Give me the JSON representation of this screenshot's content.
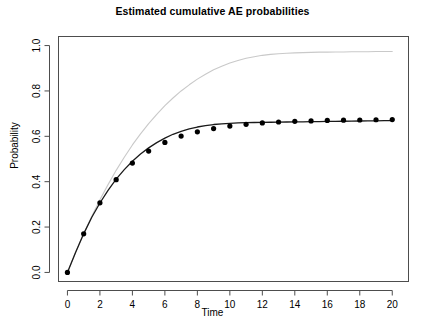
{
  "chart_data": {
    "type": "line",
    "title": "Estimated cumulative AE probabilities",
    "xlabel": "Time",
    "ylabel": "Probability",
    "xlim": [
      -0.55,
      21.0
    ],
    "ylim": [
      -0.04,
      1.04
    ],
    "xticks": [
      0,
      2,
      4,
      6,
      8,
      10,
      12,
      14,
      16,
      18,
      20
    ],
    "xticklabels": [
      "0",
      "2",
      "4",
      "6",
      "8",
      "10",
      "12",
      "14",
      "16",
      "18",
      "20"
    ],
    "yticks": [
      0.0,
      0.2,
      0.4,
      0.6,
      0.8,
      1.0
    ],
    "yticklabels": [
      "0.0",
      "0.2",
      "0.4",
      "0.6",
      "0.8",
      "1.0"
    ],
    "grid": false,
    "legend": "none",
    "box": true,
    "series": [
      {
        "name": "Nelson-Aalen cumulative hazard estimate",
        "style": "line",
        "color": "#c9c9c9",
        "width": 1.1,
        "x": [
          0,
          0.5,
          1,
          1.5,
          2,
          2.5,
          3,
          3.5,
          4,
          4.5,
          5,
          5.5,
          6,
          6.5,
          7,
          7.5,
          8,
          8.5,
          9,
          9.5,
          10,
          10.5,
          11,
          11.5,
          12,
          12.5,
          13,
          13.5,
          14,
          14.5,
          15,
          15.5,
          16,
          16.5,
          17,
          17.5,
          18,
          18.5,
          19,
          19.5,
          20
        ],
        "y": [
          0.0,
          0.088,
          0.172,
          0.248,
          0.32,
          0.387,
          0.45,
          0.508,
          0.562,
          0.611,
          0.656,
          0.697,
          0.735,
          0.769,
          0.8,
          0.827,
          0.852,
          0.874,
          0.893,
          0.909,
          0.923,
          0.934,
          0.944,
          0.951,
          0.957,
          0.961,
          0.964,
          0.966,
          0.968,
          0.969,
          0.97,
          0.971,
          0.971,
          0.972,
          0.972,
          0.973,
          0.973,
          0.973,
          0.974,
          0.974,
          0.974
        ]
      },
      {
        "name": "Aalen-Johansen / parametric estimate",
        "style": "line",
        "color": "#1a1a1a",
        "width": 1.3,
        "x": [
          0,
          0.5,
          1,
          1.5,
          2,
          2.5,
          3,
          3.5,
          4,
          4.5,
          5,
          5.5,
          6,
          6.5,
          7,
          7.5,
          8,
          8.5,
          9,
          9.5,
          10,
          10.5,
          11,
          11.5,
          12,
          12.5,
          13,
          13.5,
          14,
          14.5,
          15,
          15.5,
          16,
          16.5,
          17,
          17.5,
          18,
          18.5,
          19,
          19.5,
          20
        ],
        "y": [
          0.0,
          0.088,
          0.17,
          0.243,
          0.306,
          0.362,
          0.411,
          0.453,
          0.49,
          0.522,
          0.549,
          0.572,
          0.592,
          0.609,
          0.622,
          0.633,
          0.641,
          0.647,
          0.652,
          0.655,
          0.657,
          0.659,
          0.66,
          0.661,
          0.6615,
          0.662,
          0.6625,
          0.663,
          0.6635,
          0.664,
          0.6645,
          0.665,
          0.6655,
          0.666,
          0.6665,
          0.667,
          0.6675,
          0.668,
          0.6685,
          0.669,
          0.6695
        ]
      },
      {
        "name": "Empirical cumulative AE probability (points)",
        "style": "points",
        "color": "#000000",
        "size": 2.6,
        "x": [
          0,
          1,
          2,
          3,
          4,
          5,
          6,
          7,
          8,
          9,
          10,
          11,
          12,
          13,
          14,
          15,
          16,
          17,
          18,
          19,
          20
        ],
        "y": [
          0.0,
          0.17,
          0.307,
          0.409,
          0.482,
          0.535,
          0.573,
          0.601,
          0.62,
          0.634,
          0.645,
          0.653,
          0.659,
          0.663,
          0.666,
          0.668,
          0.67,
          0.671,
          0.672,
          0.673,
          0.674
        ]
      }
    ]
  }
}
